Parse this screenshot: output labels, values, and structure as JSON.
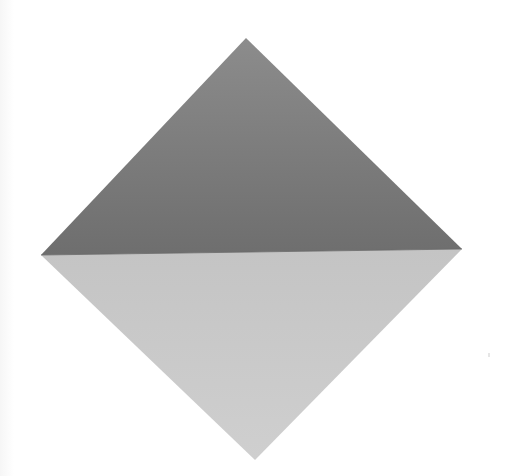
{
  "diagram": {
    "type": "folded-square",
    "canvas": {
      "width": 507,
      "height": 476,
      "background": "#ffffff"
    },
    "vertices": {
      "top": [
        246,
        38
      ],
      "left": [
        41,
        255
      ],
      "right": [
        462,
        249
      ],
      "bottom": [
        255,
        460
      ]
    },
    "upper_triangle": {
      "name": "colored-side",
      "color_top": "#8c8c8c",
      "color_bottom": "#6e6e6e"
    },
    "lower_triangle": {
      "name": "white-side",
      "color_top": "#c4c4c4",
      "color_bottom": "#cfcfcf"
    },
    "fold_line": {
      "from": [
        41,
        255
      ],
      "to": [
        462,
        249
      ]
    }
  }
}
